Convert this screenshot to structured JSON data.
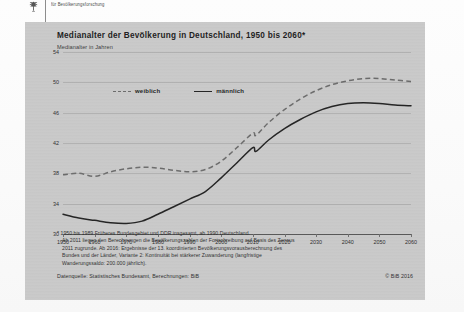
{
  "header": {
    "logo_icon": "german-eagle-icon",
    "organization": "für Bevölkerungsforschung"
  },
  "chart_data": {
    "type": "line",
    "title": "Medianalter der Bevölkerung in Deutschland, 1950 bis 2060*",
    "subtitle": "Medianalter in Jahren",
    "ylabel": "Medianalter in Jahren",
    "xlabel": "",
    "ylim": [
      30,
      54
    ],
    "xlim": [
      1950,
      2060
    ],
    "yticks": [
      54,
      50,
      46,
      42,
      38,
      34,
      30
    ],
    "xticks": [
      1950,
      1960,
      1970,
      1980,
      1990,
      2000,
      2010,
      2020,
      2030,
      2040,
      2050,
      2060
    ],
    "grid": true,
    "legend_position": "top-left",
    "x": [
      1950,
      1955,
      1960,
      1965,
      1970,
      1975,
      1980,
      1985,
      1990,
      1995,
      2000,
      2005,
      2010,
      2011,
      2015,
      2020,
      2025,
      2030,
      2035,
      2040,
      2045,
      2050,
      2055,
      2060
    ],
    "series": [
      {
        "name": "weiblich",
        "style": "dashed",
        "color": "#6b6b6b",
        "values": [
          37.8,
          38.0,
          37.6,
          38.2,
          38.6,
          38.8,
          38.7,
          38.4,
          38.2,
          38.5,
          39.6,
          41.4,
          43.3,
          43.0,
          44.7,
          46.4,
          47.8,
          48.9,
          49.7,
          50.2,
          50.5,
          50.5,
          50.3,
          50.1
        ]
      },
      {
        "name": "männlich",
        "style": "solid",
        "color": "#232323",
        "values": [
          32.6,
          32.1,
          31.8,
          31.5,
          31.4,
          31.7,
          32.6,
          33.6,
          34.6,
          35.6,
          37.4,
          39.4,
          41.4,
          40.9,
          42.4,
          43.9,
          45.1,
          46.1,
          46.8,
          47.2,
          47.3,
          47.2,
          47.0,
          46.9
        ]
      }
    ]
  },
  "legend": {
    "items": [
      {
        "label": "weiblich",
        "style": "dashed"
      },
      {
        "label": "männlich",
        "style": "solid"
      }
    ]
  },
  "footnotes": {
    "marker": "*",
    "lines": [
      "1950 bis 1989 Früheres Bundesgebiet und DDR insgesamt, ab 1990 Deutschland.",
      "Ab 2011 liegen den Berechnungen die Bevölkerungszahlen der Fortschreibung auf Basis des Zensus",
      "2011 zugrunde. Ab 2016: Ergebnisse der 13. koordinierten Bevölkerungsvorausberechnung des",
      "Bundes und der Länder, Variante 2: Kontinuität bei stärkerer Zuwanderung (langfristige",
      "Wanderungssaldo: 200.000 jährlich)."
    ]
  },
  "source": "Datenquelle: Statistisches Bundesamt, Berechnungen: BiB",
  "copyright": "© BiB 2016"
}
